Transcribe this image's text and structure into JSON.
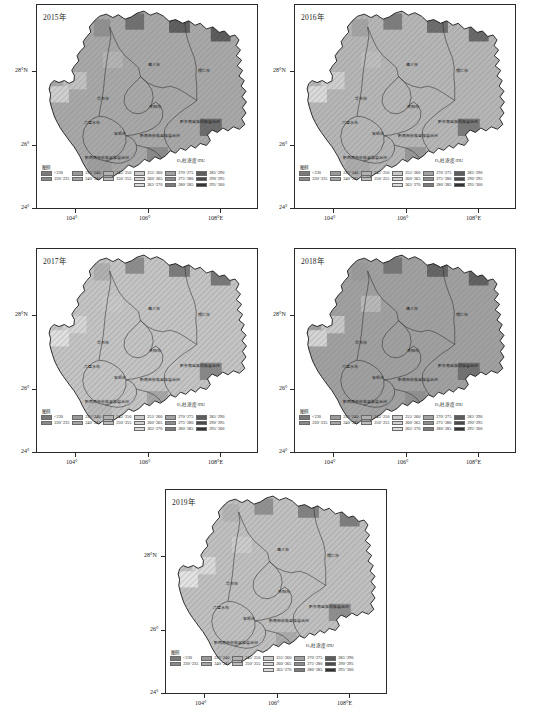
{
  "figure": {
    "kind": "multi-panel-choropleth-map",
    "region": "Guizhou Province, China",
    "variable": "O3 column concentration",
    "unit": "DU"
  },
  "panels": [
    {
      "id": "p2015",
      "title": "2015年"
    },
    {
      "id": "p2016",
      "title": "2016年"
    },
    {
      "id": "p2017",
      "title": "2017年"
    },
    {
      "id": "p2018",
      "title": "2018年"
    },
    {
      "id": "p2019",
      "title": "2019年"
    }
  ],
  "axes": {
    "y_ticks": [
      "28°N",
      "26°",
      "24°"
    ],
    "x_ticks": [
      "104°",
      "106°",
      "108°E"
    ]
  },
  "legend": {
    "caption": "图例",
    "unit_label": "O₃柱浓度/DU",
    "columns": [
      [
        {
          "label": "<230",
          "color": "#7a7a7a"
        },
        {
          "label": "230~235",
          "color": "#8a8a8a"
        }
      ],
      [
        {
          "label": "235~240",
          "color": "#9a9a9a"
        },
        {
          "label": "240~245",
          "color": "#a6a6a6"
        }
      ],
      [
        {
          "label": "245~250",
          "color": "#b0b0b0"
        },
        {
          "label": "250~255",
          "color": "#bcbcbc"
        }
      ],
      [
        {
          "label": "255~260",
          "color": "#c8c8c8"
        },
        {
          "label": "260~265",
          "color": "#d2d2d2"
        },
        {
          "label": "265~270",
          "color": "#dcdcdc"
        }
      ],
      [
        {
          "label": "270~275",
          "color": "#a2a2a2"
        },
        {
          "label": "275~280",
          "color": "#8e8e8e"
        },
        {
          "label": "280~285",
          "color": "#7c7c7c"
        }
      ],
      [
        {
          "label": "285~290",
          "color": "#5e5e5e"
        },
        {
          "label": "290~295",
          "color": "#4a4a4a"
        },
        {
          "label": "295~300",
          "color": "#333333"
        }
      ]
    ]
  },
  "place_labels": [
    {
      "name": "遵义市",
      "x": 0.53,
      "y": 0.3
    },
    {
      "name": "铜仁市",
      "x": 0.76,
      "y": 0.33
    },
    {
      "name": "毕节市",
      "x": 0.3,
      "y": 0.47
    },
    {
      "name": "贵阳市",
      "x": 0.535,
      "y": 0.505
    },
    {
      "name": "六盘水市",
      "x": 0.25,
      "y": 0.585
    },
    {
      "name": "安顺市",
      "x": 0.375,
      "y": 0.64
    },
    {
      "name": "黔东南苗族侗族自治州",
      "x": 0.74,
      "y": 0.58
    },
    {
      "name": "黔南布依族苗族自治州",
      "x": 0.56,
      "y": 0.65
    },
    {
      "name": "黔西南布依族苗族自治州",
      "x": 0.32,
      "y": 0.76
    }
  ],
  "chart_data": {
    "type": "heatmap",
    "xlabel": "Longitude",
    "ylabel": "Latitude",
    "xlim": [
      103.3,
      109.8
    ],
    "ylim": [
      24.2,
      29.3
    ],
    "x_tick_values": [
      104,
      106,
      108
    ],
    "y_tick_values": [
      28,
      26,
      24
    ],
    "colorbar_label": "O₃柱浓度/DU",
    "class_breaks": [
      230,
      235,
      240,
      245,
      250,
      255,
      260,
      265,
      270,
      275,
      280,
      285,
      290,
      295,
      300
    ],
    "panel_summary": [
      {
        "year": 2015,
        "dominant_class": "270~275",
        "range_observed": "255~295"
      },
      {
        "year": 2016,
        "dominant_class": "265~270",
        "range_observed": "255~290"
      },
      {
        "year": 2017,
        "dominant_class": "260~265",
        "range_observed": "250~285"
      },
      {
        "year": 2018,
        "dominant_class": "270~275",
        "range_observed": "255~290"
      },
      {
        "year": 2019,
        "dominant_class": "260~265",
        "range_observed": "250~285"
      }
    ]
  }
}
